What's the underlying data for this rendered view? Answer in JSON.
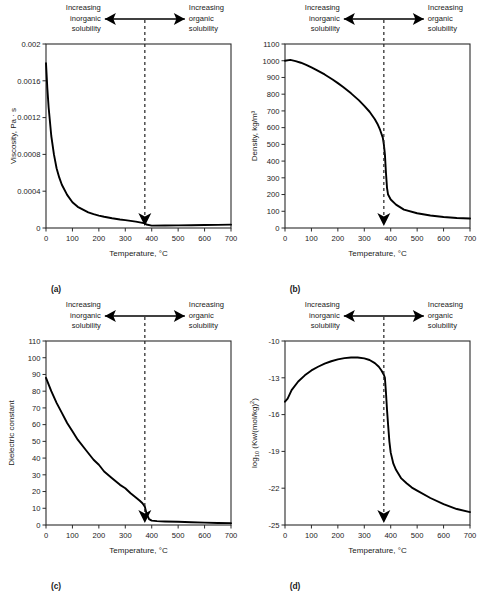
{
  "figure": {
    "annotation_left": [
      "Increasing",
      "inorganic",
      "solubility"
    ],
    "annotation_right": [
      "Increasing",
      "organic",
      "solubility"
    ],
    "xlabel": "Temperature, °C",
    "xticks": [
      "0",
      "100",
      "200",
      "300",
      "400",
      "500",
      "600",
      "700"
    ],
    "critical_temperature": 374,
    "line_color": "#000000",
    "frame_color": "#2b2b2b"
  },
  "panels": [
    {
      "letter": "(a)",
      "ylabel": "Viscosity, Pa · s",
      "yticks": [
        "0",
        "0.0004",
        "0.0008",
        "0.0012",
        "0.0016",
        "0.002"
      ]
    },
    {
      "letter": "(b)",
      "ylabel": "Density, kg/m³",
      "yticks": [
        "0",
        "100",
        "200",
        "300",
        "400",
        "500",
        "600",
        "700",
        "800",
        "900",
        "1000",
        "1100"
      ]
    },
    {
      "letter": "(c)",
      "ylabel": "Dielectric constant",
      "yticks": [
        "0",
        "10",
        "20",
        "30",
        "40",
        "50",
        "60",
        "70",
        "80",
        "90",
        "100",
        "110"
      ]
    },
    {
      "letter": "(d)",
      "ylabel_prefix": "log",
      "ylabel_sub": "10",
      "ylabel_rest": " (Kw/(mol/kg)",
      "ylabel_sup": "2",
      "ylabel_close": ")",
      "yticks": [
        "-25",
        "-22",
        "-19",
        "-16",
        "-13",
        "-10"
      ]
    }
  ],
  "chart_data": [
    {
      "type": "line",
      "panel": "(a)",
      "title": "",
      "xlabel": "Temperature, °C",
      "ylabel": "Viscosity, Pa · s",
      "xlim": [
        0,
        700
      ],
      "ylim": [
        0,
        0.002
      ],
      "xticks": [
        0,
        100,
        200,
        300,
        400,
        500,
        600,
        700
      ],
      "yticks": [
        0,
        0.0004,
        0.0008,
        0.0012,
        0.0016,
        0.002
      ],
      "grid": false,
      "legend": null,
      "annotations": [
        {
          "text": "Increasing inorganic solubility",
          "position": "top-left"
        },
        {
          "text": "Increasing organic solubility",
          "position": "top-right"
        },
        {
          "text": "critical point dashed line",
          "x": 374
        }
      ],
      "x": [
        0,
        5,
        10,
        20,
        30,
        40,
        50,
        60,
        80,
        100,
        120,
        140,
        160,
        180,
        200,
        220,
        250,
        280,
        300,
        320,
        340,
        360,
        374,
        380,
        400,
        450,
        500,
        550,
        600,
        650,
        700
      ],
      "values": [
        0.00179,
        0.00152,
        0.00131,
        0.001,
        0.0008,
        0.00065,
        0.00055,
        0.00047,
        0.00036,
        0.00028,
        0.00023,
        0.0002,
        0.00017,
        0.00015,
        0.000135,
        0.000122,
        0.000106,
        9.3e-05,
        8.6e-05,
        7.8e-05,
        6.9e-05,
        5.8e-05,
        5e-05,
        3.8e-05,
        2.55e-05,
        2.65e-05,
        2.85e-05,
        3.05e-05,
        3.25e-05,
        3.45e-05,
        3.65e-05
      ]
    },
    {
      "type": "line",
      "panel": "(b)",
      "title": "",
      "xlabel": "Temperature, °C",
      "ylabel": "Density, kg/m³",
      "xlim": [
        0,
        700
      ],
      "ylim": [
        0,
        1100
      ],
      "xticks": [
        0,
        100,
        200,
        300,
        400,
        500,
        600,
        700
      ],
      "yticks": [
        0,
        100,
        200,
        300,
        400,
        500,
        600,
        700,
        800,
        900,
        1000,
        1100
      ],
      "grid": false,
      "legend": null,
      "annotations": [
        {
          "text": "Increasing inorganic solubility",
          "position": "top-left"
        },
        {
          "text": "Increasing organic solubility",
          "position": "top-right"
        },
        {
          "text": "critical point dashed line",
          "x": 374
        }
      ],
      "x": [
        0,
        20,
        40,
        60,
        80,
        100,
        120,
        150,
        180,
        200,
        220,
        250,
        280,
        300,
        320,
        340,
        350,
        360,
        370,
        374,
        378,
        382,
        386,
        390,
        400,
        420,
        450,
        500,
        550,
        600,
        650,
        700
      ],
      "values": [
        1000,
        1005,
        998,
        988,
        975,
        960,
        944,
        918,
        888,
        866,
        843,
        805,
        763,
        730,
        695,
        650,
        622,
        586,
        540,
        500,
        440,
        330,
        240,
        200,
        170,
        140,
        110,
        88,
        75,
        66,
        60,
        57
      ]
    },
    {
      "type": "line",
      "panel": "(c)",
      "title": "",
      "xlabel": "Temperature, °C",
      "ylabel": "Dielectric constant",
      "xlim": [
        0,
        700
      ],
      "ylim": [
        0,
        110
      ],
      "xticks": [
        0,
        100,
        200,
        300,
        400,
        500,
        600,
        700
      ],
      "yticks": [
        0,
        10,
        20,
        30,
        40,
        50,
        60,
        70,
        80,
        90,
        100,
        110
      ],
      "grid": false,
      "legend": null,
      "annotations": [
        {
          "text": "Increasing inorganic solubility",
          "position": "top-left"
        },
        {
          "text": "Increasing organic solubility",
          "position": "top-right"
        },
        {
          "text": "critical point dashed line",
          "x": 374
        }
      ],
      "x": [
        0,
        20,
        40,
        60,
        80,
        100,
        120,
        150,
        180,
        200,
        220,
        250,
        280,
        300,
        320,
        340,
        355,
        365,
        374,
        380,
        390,
        400,
        420,
        450,
        500,
        550,
        600,
        650,
        700
      ],
      "values": [
        88,
        80,
        73,
        67,
        61,
        56,
        51,
        45,
        39,
        36,
        32,
        28,
        24,
        22,
        19,
        16.5,
        14.5,
        13,
        11,
        7,
        3.5,
        2.6,
        2.3,
        2.1,
        1.9,
        1.6,
        1.4,
        1.2,
        1.1
      ]
    },
    {
      "type": "line",
      "panel": "(d)",
      "title": "",
      "xlabel": "Temperature, °C",
      "ylabel": "log10 (Kw/(mol/kg)2)",
      "xlim": [
        0,
        700
      ],
      "ylim": [
        -25,
        -10
      ],
      "xticks": [
        0,
        100,
        200,
        300,
        400,
        500,
        600,
        700
      ],
      "yticks": [
        -25,
        -22,
        -19,
        -16,
        -13,
        -10
      ],
      "grid": false,
      "legend": null,
      "annotations": [
        {
          "text": "Increasing inorganic solubility",
          "position": "top-left"
        },
        {
          "text": "Increasing organic solubility",
          "position": "top-right"
        },
        {
          "text": "critical point dashed line",
          "x": 374
        }
      ],
      "x": [
        0,
        10,
        25,
        50,
        75,
        100,
        125,
        150,
        175,
        200,
        225,
        250,
        275,
        300,
        320,
        340,
        355,
        365,
        374,
        378,
        382,
        386,
        390,
        395,
        400,
        410,
        420,
        440,
        460,
        480,
        500,
        550,
        600,
        650,
        700
      ],
      "values": [
        -14.95,
        -14.7,
        -14.0,
        -13.3,
        -12.8,
        -12.4,
        -12.1,
        -11.85,
        -11.65,
        -11.5,
        -11.4,
        -11.35,
        -11.35,
        -11.42,
        -11.55,
        -11.8,
        -12.1,
        -12.4,
        -12.75,
        -13.0,
        -14.2,
        -15.6,
        -16.8,
        -18.2,
        -19.1,
        -20.0,
        -20.5,
        -21.2,
        -21.6,
        -21.95,
        -22.2,
        -22.8,
        -23.3,
        -23.7,
        -23.95
      ]
    }
  ]
}
